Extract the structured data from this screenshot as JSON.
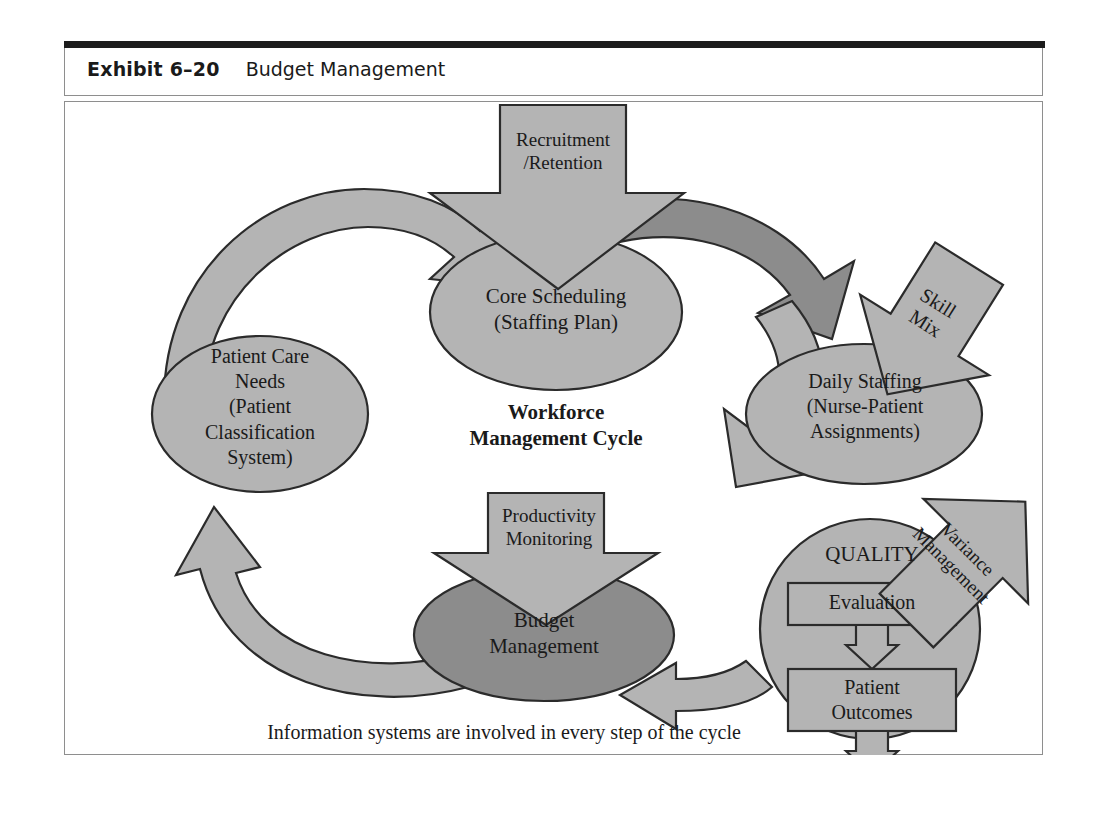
{
  "exhibit": {
    "label": "Exhibit 6–20",
    "title": "Budget Management"
  },
  "diagram": {
    "center_label_line1": "Workforce",
    "center_label_line2": "Management Cycle",
    "caption": "Information systems are involved in every step of the cycle",
    "nodes": {
      "core_scheduling": {
        "line1": "Core Scheduling",
        "line2": "(Staffing Plan)"
      },
      "patient_care_needs": {
        "line1": "Patient Care",
        "line2": "Needs",
        "line3": "(Patient",
        "line4": "Classification",
        "line5": "System)"
      },
      "daily_staffing": {
        "line1": "Daily Staffing",
        "line2": "(Nurse-Patient",
        "line3": "Assignments)"
      },
      "budget_management": {
        "line1": "Budget",
        "line2": "Management"
      },
      "quality": {
        "title": "QUALITY",
        "box1": "Evaluation",
        "box2_line1": "Patient",
        "box2_line2": "Outcomes"
      }
    },
    "input_arrows": {
      "recruitment": {
        "line1": "Recruitment",
        "line2": "/Retention"
      },
      "skill_mix": {
        "line1": "Skill",
        "line2": "Mix"
      },
      "variance": {
        "line1": "Variance",
        "line2": "Management"
      },
      "productivity": {
        "line1": "Productivity",
        "line2": "Monitoring"
      }
    },
    "colors": {
      "fill_light": "#b4b4b4",
      "fill_dark": "#8c8c8c",
      "stroke": "#2b2b2b",
      "frame_border": "#8e8e8e",
      "band": "#1c1c1c",
      "text": "#1a1a1a"
    }
  }
}
